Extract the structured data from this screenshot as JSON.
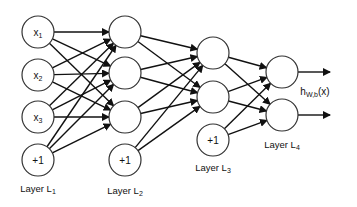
{
  "diagram": {
    "layers": [
      {
        "name": "Layer L1",
        "label_main": "Layer L",
        "label_sub": "1",
        "x": 38,
        "label_y": 192,
        "nodes": [
          {
            "y": 32,
            "text": "x",
            "sub": "1"
          },
          {
            "y": 75,
            "text": "x",
            "sub": "2"
          },
          {
            "y": 117,
            "text": "x",
            "sub": "3"
          },
          {
            "y": 160,
            "text": "+1",
            "sub": "",
            "bias": true
          }
        ]
      },
      {
        "name": "Layer L2",
        "label_main": "Layer L",
        "label_sub": "2",
        "x": 125,
        "label_y": 194,
        "nodes": [
          {
            "y": 32,
            "text": "",
            "sub": ""
          },
          {
            "y": 73,
            "text": "",
            "sub": ""
          },
          {
            "y": 117,
            "text": "",
            "sub": ""
          },
          {
            "y": 160,
            "text": "+1",
            "sub": "",
            "bias": true
          }
        ]
      },
      {
        "name": "Layer L3",
        "label_main": "Layer L",
        "label_sub": "3",
        "x": 213,
        "label_y": 171,
        "nodes": [
          {
            "y": 53,
            "text": "",
            "sub": ""
          },
          {
            "y": 97,
            "text": "",
            "sub": ""
          },
          {
            "y": 140,
            "text": "+1",
            "sub": "",
            "bias": true
          }
        ]
      },
      {
        "name": "Layer L4",
        "label_main": "Layer L",
        "label_sub": "4",
        "x": 282,
        "label_y": 148,
        "nodes": [
          {
            "y": 72,
            "text": "",
            "sub": ""
          },
          {
            "y": 115,
            "text": "",
            "sub": ""
          }
        ]
      }
    ],
    "node_radius": 16,
    "output_label": {
      "main": "h",
      "sub": "W,b",
      "suffix": "(x)",
      "x": 315,
      "y": 95
    },
    "output_arrow_end_x": 330,
    "colors": {
      "stroke": "#333333",
      "edge": "#111111",
      "background": "#ffffff"
    }
  }
}
